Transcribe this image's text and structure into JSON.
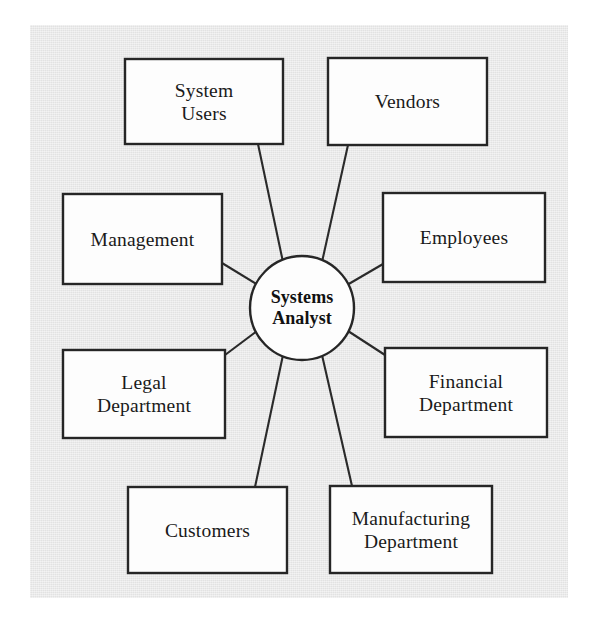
{
  "figure": {
    "panel_color": "#e6e6e6",
    "page_color": "#ffffff",
    "box_fill": "#fdfdfd",
    "stroke_color": "#262626",
    "text_color": "#1a1a1a"
  },
  "hub": {
    "label": "Systems\nAnalyst",
    "line1": "Systems",
    "line2": "Analyst",
    "cx": 302,
    "cy": 308,
    "r": 52
  },
  "nodes": [
    {
      "id": "system-users",
      "label": "System\nUsers",
      "x": 125,
      "y": 59,
      "w": 158,
      "h": 85
    },
    {
      "id": "vendors",
      "label": "Vendors",
      "x": 328,
      "y": 58,
      "w": 159,
      "h": 87
    },
    {
      "id": "management",
      "label": "Management",
      "x": 63,
      "y": 194,
      "w": 159,
      "h": 90
    },
    {
      "id": "employees",
      "label": "Employees",
      "x": 383,
      "y": 193,
      "w": 162,
      "h": 89
    },
    {
      "id": "legal-department",
      "label": "Legal\nDepartment",
      "x": 63,
      "y": 350,
      "w": 162,
      "h": 88
    },
    {
      "id": "financial-department",
      "label": "Financial\nDepartment",
      "x": 385,
      "y": 348,
      "w": 162,
      "h": 89
    },
    {
      "id": "customers",
      "label": "Customers",
      "x": 128,
      "y": 487,
      "w": 159,
      "h": 86
    },
    {
      "id": "manufacturing-department",
      "label": "Manufacturing\nDepartment",
      "x": 330,
      "y": 486,
      "w": 162,
      "h": 87
    }
  ],
  "connectors": [
    {
      "id": "hub-to-system-users",
      "x1": 283,
      "y1": 262,
      "x2": 258,
      "y2": 144
    },
    {
      "id": "hub-to-vendors",
      "x1": 322,
      "y1": 262,
      "x2": 348,
      "y2": 145
    },
    {
      "id": "hub-to-management",
      "x1": 258,
      "y1": 285,
      "x2": 222,
      "y2": 263
    },
    {
      "id": "hub-to-employees",
      "x1": 347,
      "y1": 285,
      "x2": 383,
      "y2": 264
    },
    {
      "id": "hub-to-legal",
      "x1": 257,
      "y1": 331,
      "x2": 225,
      "y2": 355
    },
    {
      "id": "hub-to-financial",
      "x1": 348,
      "y1": 331,
      "x2": 385,
      "y2": 355
    },
    {
      "id": "hub-to-customers",
      "x1": 283,
      "y1": 355,
      "x2": 255,
      "y2": 487
    },
    {
      "id": "hub-to-manufacturing",
      "x1": 322,
      "y1": 355,
      "x2": 352,
      "y2": 486
    }
  ]
}
